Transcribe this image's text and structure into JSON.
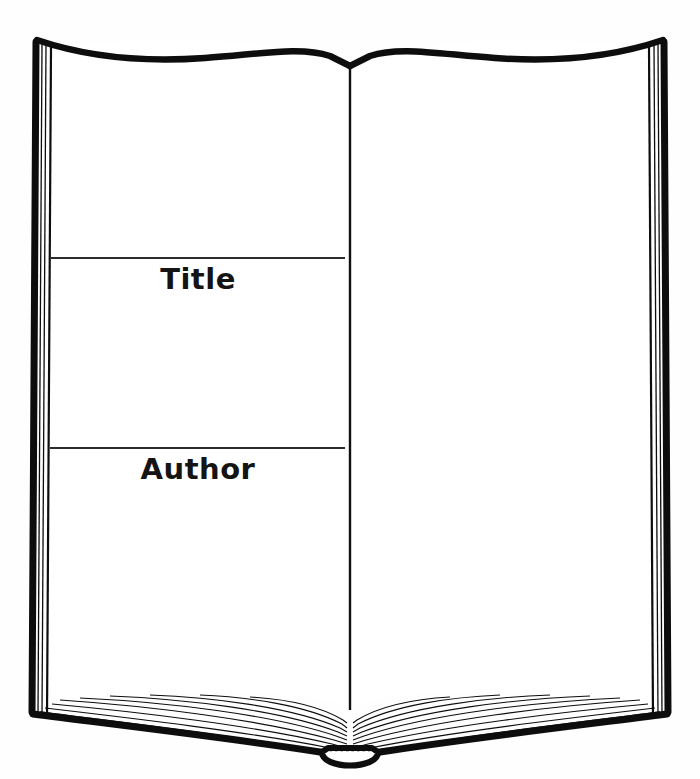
{
  "page": {
    "name": "open-book-worksheet",
    "background_color": "#fefefe",
    "ink_color": "#0d0d0d",
    "rule_color": "#2b2b2b",
    "width": 700,
    "height": 779
  },
  "book": {
    "left_page": {
      "fields": [
        {
          "id": "title",
          "label": "Title",
          "rule_y": 258,
          "rule_x_start": 50,
          "rule_x_end": 345
        },
        {
          "id": "author",
          "label": "Author",
          "rule_y": 448,
          "rule_x_start": 50,
          "rule_x_end": 345
        }
      ]
    },
    "right_page": {
      "fields": []
    },
    "spine": {
      "x": 350,
      "top_y": 60,
      "bottom_y": 712
    }
  }
}
